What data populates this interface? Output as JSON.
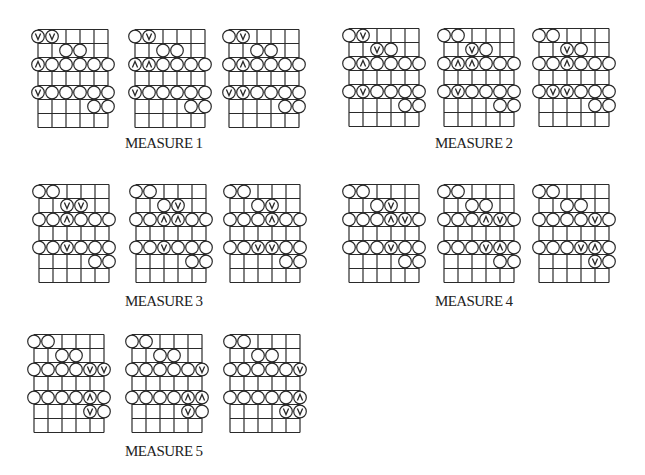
{
  "grid": {
    "strings": 6,
    "frets": 7,
    "cell_w": 14,
    "cell_h": 14,
    "circle_r": 6.3,
    "line_color": "#2a2a2a"
  },
  "symbols": {
    "o": "plain-circle",
    "v": "down-stroke-circle",
    "^": "up-stroke-circle",
    "": "empty"
  },
  "measures": [
    {
      "label": "MEASURE 1",
      "label_pos": [
        125,
        135
      ]
    },
    {
      "label": "MEASURE 2",
      "label_pos": [
        435,
        135
      ]
    },
    {
      "label": "MEASURE 3",
      "label_pos": [
        125,
        293
      ]
    },
    {
      "label": "MEASURE 4",
      "label_pos": [
        435,
        293
      ]
    },
    {
      "label": "MEASURE 5",
      "label_pos": [
        125,
        443
      ]
    }
  ],
  "diagrams": [
    {
      "measure": 1,
      "pos": [
        38,
        29
      ],
      "rows": [
        [
          "v",
          "v",
          "",
          "",
          "",
          ""
        ],
        [
          "",
          "",
          "o",
          "o",
          "",
          ""
        ],
        [
          "^",
          "o",
          "o",
          "o",
          "o",
          "o"
        ],
        [
          "",
          "",
          "",
          "",
          "",
          ""
        ],
        [
          "v",
          "o",
          "o",
          "o",
          "o",
          "o"
        ],
        [
          "",
          "",
          "",
          "",
          "o",
          "o"
        ],
        [
          "",
          "",
          "",
          "",
          "",
          ""
        ]
      ]
    },
    {
      "measure": 1,
      "pos": [
        135,
        29
      ],
      "rows": [
        [
          "o",
          "v",
          "",
          "",
          "",
          ""
        ],
        [
          "",
          "",
          "o",
          "o",
          "",
          ""
        ],
        [
          "^",
          "^",
          "o",
          "o",
          "o",
          "o"
        ],
        [
          "",
          "",
          "",
          "",
          "",
          ""
        ],
        [
          "v",
          "o",
          "o",
          "o",
          "o",
          "o"
        ],
        [
          "",
          "",
          "",
          "",
          "o",
          "o"
        ],
        [
          "",
          "",
          "",
          "",
          "",
          ""
        ]
      ]
    },
    {
      "measure": 1,
      "pos": [
        229,
        29
      ],
      "rows": [
        [
          "o",
          "v",
          "",
          "",
          "",
          ""
        ],
        [
          "",
          "",
          "o",
          "o",
          "",
          ""
        ],
        [
          "o",
          "^",
          "o",
          "o",
          "o",
          "o"
        ],
        [
          "",
          "",
          "",
          "",
          "",
          ""
        ],
        [
          "v",
          "v",
          "o",
          "o",
          "o",
          "o"
        ],
        [
          "",
          "",
          "",
          "",
          "o",
          "o"
        ],
        [
          "",
          "",
          "",
          "",
          "",
          ""
        ]
      ]
    },
    {
      "measure": 2,
      "pos": [
        349,
        28
      ],
      "rows": [
        [
          "o",
          "v",
          "",
          "",
          "",
          ""
        ],
        [
          "",
          "",
          "v",
          "o",
          "",
          ""
        ],
        [
          "o",
          "^",
          "o",
          "o",
          "o",
          "o"
        ],
        [
          "",
          "",
          "",
          "",
          "",
          ""
        ],
        [
          "o",
          "v",
          "o",
          "o",
          "o",
          "o"
        ],
        [
          "",
          "",
          "",
          "",
          "o",
          "o"
        ],
        [
          "",
          "",
          "",
          "",
          "",
          ""
        ]
      ]
    },
    {
      "measure": 2,
      "pos": [
        444,
        28
      ],
      "rows": [
        [
          "o",
          "o",
          "",
          "",
          "",
          ""
        ],
        [
          "",
          "",
          "v",
          "o",
          "",
          ""
        ],
        [
          "o",
          "^",
          "^",
          "o",
          "o",
          "o"
        ],
        [
          "",
          "",
          "",
          "",
          "",
          ""
        ],
        [
          "o",
          "v",
          "o",
          "o",
          "o",
          "o"
        ],
        [
          "",
          "",
          "",
          "",
          "o",
          "o"
        ],
        [
          "",
          "",
          "",
          "",
          "",
          ""
        ]
      ]
    },
    {
      "measure": 2,
      "pos": [
        539,
        28
      ],
      "rows": [
        [
          "o",
          "o",
          "",
          "",
          "",
          ""
        ],
        [
          "",
          "",
          "v",
          "o",
          "",
          ""
        ],
        [
          "o",
          "o",
          "^",
          "o",
          "o",
          "o"
        ],
        [
          "",
          "",
          "",
          "",
          "",
          ""
        ],
        [
          "o",
          "v",
          "v",
          "o",
          "o",
          "o"
        ],
        [
          "",
          "",
          "",
          "",
          "o",
          "o"
        ],
        [
          "",
          "",
          "",
          "",
          "",
          ""
        ]
      ]
    },
    {
      "measure": 3,
      "pos": [
        39,
        184
      ],
      "rows": [
        [
          "o",
          "o",
          "",
          "",
          "",
          ""
        ],
        [
          "",
          "",
          "v",
          "v",
          "",
          ""
        ],
        [
          "o",
          "o",
          "^",
          "o",
          "o",
          "o"
        ],
        [
          "",
          "",
          "",
          "",
          "",
          ""
        ],
        [
          "o",
          "o",
          "v",
          "o",
          "o",
          "o"
        ],
        [
          "",
          "",
          "",
          "",
          "o",
          "o"
        ],
        [
          "",
          "",
          "",
          "",
          "",
          ""
        ]
      ]
    },
    {
      "measure": 3,
      "pos": [
        136,
        184
      ],
      "rows": [
        [
          "o",
          "o",
          "",
          "",
          "",
          ""
        ],
        [
          "",
          "",
          "o",
          "v",
          "",
          ""
        ],
        [
          "o",
          "o",
          "^",
          "^",
          "o",
          "o"
        ],
        [
          "",
          "",
          "",
          "",
          "",
          ""
        ],
        [
          "o",
          "o",
          "v",
          "o",
          "o",
          "o"
        ],
        [
          "",
          "",
          "",
          "",
          "o",
          "o"
        ],
        [
          "",
          "",
          "",
          "",
          "",
          ""
        ]
      ]
    },
    {
      "measure": 3,
      "pos": [
        230,
        184
      ],
      "rows": [
        [
          "o",
          "o",
          "",
          "",
          "",
          ""
        ],
        [
          "",
          "",
          "o",
          "v",
          "",
          ""
        ],
        [
          "o",
          "o",
          "o",
          "^",
          "o",
          "o"
        ],
        [
          "",
          "",
          "",
          "",
          "",
          ""
        ],
        [
          "o",
          "o",
          "v",
          "v",
          "o",
          "o"
        ],
        [
          "",
          "",
          "",
          "",
          "o",
          "o"
        ],
        [
          "",
          "",
          "",
          "",
          "",
          ""
        ]
      ]
    },
    {
      "measure": 4,
      "pos": [
        349,
        184
      ],
      "rows": [
        [
          "o",
          "o",
          "",
          "",
          "",
          ""
        ],
        [
          "",
          "",
          "o",
          "v",
          "",
          ""
        ],
        [
          "o",
          "o",
          "o",
          "^",
          "v",
          "o"
        ],
        [
          "",
          "",
          "",
          "",
          "",
          ""
        ],
        [
          "o",
          "o",
          "o",
          "v",
          "o",
          "o"
        ],
        [
          "",
          "",
          "",
          "",
          "o",
          "o"
        ],
        [
          "",
          "",
          "",
          "",
          "",
          ""
        ]
      ]
    },
    {
      "measure": 4,
      "pos": [
        444,
        184
      ],
      "rows": [
        [
          "o",
          "o",
          "",
          "",
          "",
          ""
        ],
        [
          "",
          "",
          "o",
          "o",
          "",
          ""
        ],
        [
          "o",
          "o",
          "o",
          "^",
          "v",
          "o"
        ],
        [
          "",
          "",
          "",
          "",
          "",
          ""
        ],
        [
          "o",
          "o",
          "o",
          "v",
          "^",
          "o"
        ],
        [
          "",
          "",
          "",
          "",
          "o",
          "o"
        ],
        [
          "",
          "",
          "",
          "",
          "",
          ""
        ]
      ]
    },
    {
      "measure": 4,
      "pos": [
        539,
        184
      ],
      "rows": [
        [
          "o",
          "o",
          "",
          "",
          "",
          ""
        ],
        [
          "",
          "",
          "o",
          "o",
          "",
          ""
        ],
        [
          "o",
          "o",
          "o",
          "o",
          "v",
          "o"
        ],
        [
          "",
          "",
          "",
          "",
          "",
          ""
        ],
        [
          "o",
          "o",
          "o",
          "v",
          "^",
          "o"
        ],
        [
          "",
          "",
          "",
          "",
          "v",
          "o"
        ],
        [
          "",
          "",
          "",
          "",
          "",
          ""
        ]
      ]
    },
    {
      "measure": 5,
      "pos": [
        34,
        334
      ],
      "rows": [
        [
          "o",
          "o",
          "",
          "",
          "",
          ""
        ],
        [
          "",
          "",
          "o",
          "o",
          "",
          ""
        ],
        [
          "o",
          "o",
          "o",
          "o",
          "v",
          "v"
        ],
        [
          "",
          "",
          "",
          "",
          "",
          ""
        ],
        [
          "o",
          "o",
          "o",
          "o",
          "^",
          "o"
        ],
        [
          "",
          "",
          "",
          "",
          "v",
          "o"
        ],
        [
          "",
          "",
          "",
          "",
          "",
          ""
        ]
      ]
    },
    {
      "measure": 5,
      "pos": [
        132,
        334
      ],
      "rows": [
        [
          "o",
          "o",
          "",
          "",
          "",
          ""
        ],
        [
          "",
          "",
          "o",
          "o",
          "",
          ""
        ],
        [
          "o",
          "o",
          "o",
          "o",
          "o",
          "v"
        ],
        [
          "",
          "",
          "",
          "",
          "",
          ""
        ],
        [
          "o",
          "o",
          "o",
          "o",
          "^",
          "^"
        ],
        [
          "",
          "",
          "",
          "",
          "v",
          "o"
        ],
        [
          "",
          "",
          "",
          "",
          "",
          ""
        ]
      ]
    },
    {
      "measure": 5,
      "pos": [
        230,
        334
      ],
      "rows": [
        [
          "o",
          "o",
          "",
          "",
          "",
          ""
        ],
        [
          "",
          "",
          "o",
          "o",
          "",
          ""
        ],
        [
          "o",
          "o",
          "o",
          "o",
          "o",
          "v"
        ],
        [
          "",
          "",
          "",
          "",
          "",
          ""
        ],
        [
          "o",
          "o",
          "o",
          "o",
          "o",
          "^"
        ],
        [
          "",
          "",
          "",
          "",
          "v",
          "v"
        ],
        [
          "",
          "",
          "",
          "",
          "",
          ""
        ]
      ]
    }
  ]
}
